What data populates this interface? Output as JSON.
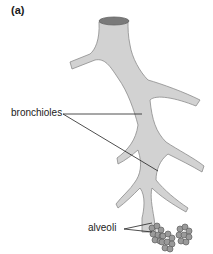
{
  "figure": {
    "panel_label": "(a)",
    "top_clipped_text": "~~~~~~~~~~~ ~~~~~~ ~~~ ~~~~~ ~~~",
    "labels": {
      "bronchioles": "bronchioles",
      "alveoli": "alveoli"
    },
    "colors": {
      "airway_fill": "#d2d2d2",
      "airway_stroke": "#8c8c8c",
      "lumen": "#7a7a7a",
      "alveoli_fill": "#9a9a9a",
      "leader_line": "#222222"
    }
  }
}
